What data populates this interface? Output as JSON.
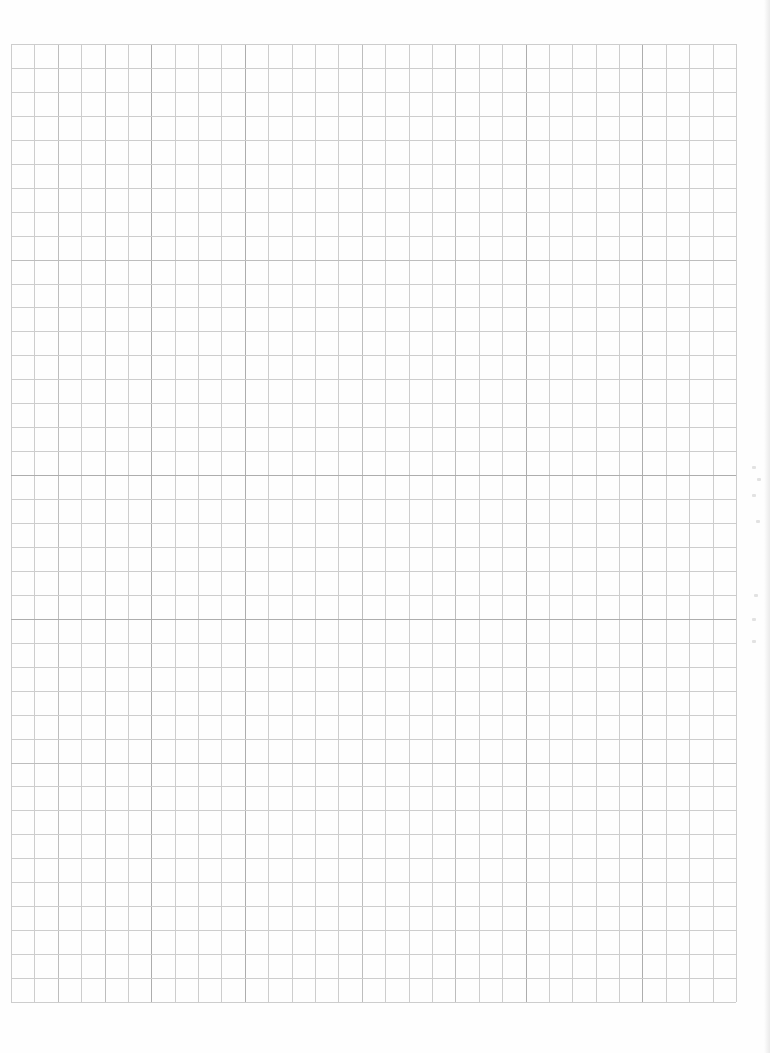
{
  "document": {
    "type": "graph-paper",
    "columns": 31,
    "rows": 40,
    "line_color": "#cdcdcd",
    "dark_line_color": "#adadad",
    "background_color": "#ffffff",
    "dark_columns": [
      6,
      10,
      22,
      27
    ],
    "mid_columns": [
      2,
      4,
      15,
      19
    ],
    "dark_rows": [
      18,
      24
    ],
    "mid_rows": [
      9,
      30
    ]
  },
  "bleed_marks": {
    "count": 7
  }
}
